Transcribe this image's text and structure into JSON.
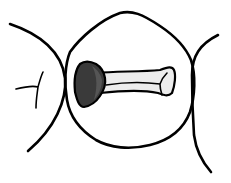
{
  "diagram": {
    "type": "dental-occlusal-view",
    "colors": {
      "background": "#ffffff",
      "stroke": "#000000",
      "box_shade": "#3a3a3a",
      "box_shade_inner": "#555555",
      "groove_fill": "#ececec"
    },
    "elements": [
      {
        "id": "adjacent-tooth-left",
        "label": ""
      },
      {
        "id": "central-tooth-outline",
        "label": ""
      },
      {
        "id": "adjacent-tooth-right",
        "label": ""
      },
      {
        "id": "proximal-box-shaded",
        "label": ""
      },
      {
        "id": "occlusal-groove-preparation",
        "label": ""
      }
    ]
  }
}
